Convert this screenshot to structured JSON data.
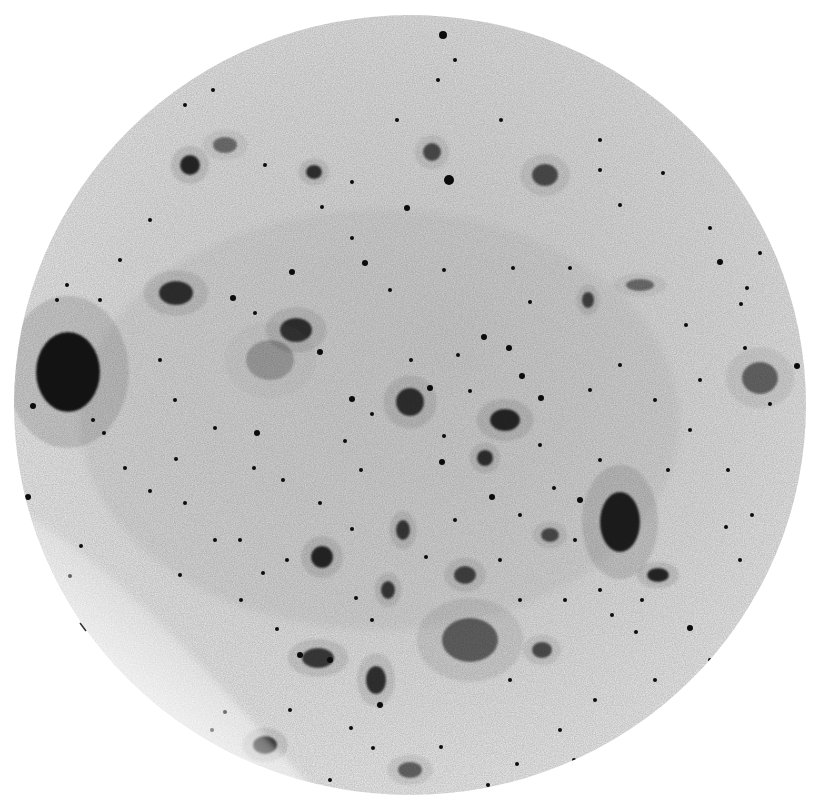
{
  "image": {
    "subject": "Inverted (negative) photographic plate of a galaxy star field",
    "width": 817,
    "height": 807,
    "background": "#ffffff",
    "field": {
      "cx": 410,
      "cy": 405,
      "rx": 396,
      "ry": 390,
      "tone": "#e4e4e4",
      "faded_edge": "#f7f7f7"
    },
    "ink": "#0d0d0d",
    "blobs": [
      {
        "x": 68,
        "y": 372,
        "rx": 32,
        "ry": 40,
        "o": 1.0
      },
      {
        "x": 620,
        "y": 522,
        "rx": 20,
        "ry": 30,
        "o": 0.95
      },
      {
        "x": 410,
        "y": 402,
        "rx": 14,
        "ry": 14,
        "o": 0.85
      },
      {
        "x": 505,
        "y": 420,
        "rx": 15,
        "ry": 11,
        "o": 0.9
      },
      {
        "x": 296,
        "y": 330,
        "rx": 16,
        "ry": 12,
        "o": 0.85
      },
      {
        "x": 176,
        "y": 293,
        "rx": 17,
        "ry": 12,
        "o": 0.85
      },
      {
        "x": 760,
        "y": 378,
        "rx": 18,
        "ry": 16,
        "o": 0.55
      },
      {
        "x": 545,
        "y": 175,
        "rx": 13,
        "ry": 11,
        "o": 0.7
      },
      {
        "x": 470,
        "y": 640,
        "rx": 28,
        "ry": 22,
        "o": 0.6
      },
      {
        "x": 318,
        "y": 658,
        "rx": 16,
        "ry": 10,
        "o": 0.8
      },
      {
        "x": 376,
        "y": 680,
        "rx": 10,
        "ry": 14,
        "o": 0.85
      },
      {
        "x": 265,
        "y": 745,
        "rx": 12,
        "ry": 9,
        "o": 0.9
      },
      {
        "x": 322,
        "y": 557,
        "rx": 11,
        "ry": 11,
        "o": 0.9
      },
      {
        "x": 658,
        "y": 575,
        "rx": 11,
        "ry": 7,
        "o": 0.9
      },
      {
        "x": 190,
        "y": 165,
        "rx": 10,
        "ry": 10,
        "o": 0.9
      },
      {
        "x": 432,
        "y": 152,
        "rx": 9,
        "ry": 9,
        "o": 0.7
      },
      {
        "x": 314,
        "y": 172,
        "rx": 8,
        "ry": 7,
        "o": 0.85
      },
      {
        "x": 270,
        "y": 360,
        "rx": 24,
        "ry": 20,
        "o": 0.25
      },
      {
        "x": 465,
        "y": 575,
        "rx": 11,
        "ry": 9,
        "o": 0.75
      },
      {
        "x": 550,
        "y": 535,
        "rx": 9,
        "ry": 7,
        "o": 0.7
      },
      {
        "x": 403,
        "y": 530,
        "rx": 7,
        "ry": 10,
        "o": 0.8
      },
      {
        "x": 388,
        "y": 590,
        "rx": 7,
        "ry": 9,
        "o": 0.8
      },
      {
        "x": 485,
        "y": 458,
        "rx": 8,
        "ry": 8,
        "o": 0.85
      },
      {
        "x": 640,
        "y": 285,
        "rx": 14,
        "ry": 6,
        "o": 0.5
      },
      {
        "x": 225,
        "y": 145,
        "rx": 12,
        "ry": 8,
        "o": 0.5
      },
      {
        "x": 588,
        "y": 300,
        "rx": 6,
        "ry": 8,
        "o": 0.75
      },
      {
        "x": 542,
        "y": 650,
        "rx": 10,
        "ry": 8,
        "o": 0.7
      },
      {
        "x": 410,
        "y": 770,
        "rx": 12,
        "ry": 8,
        "o": 0.6
      }
    ],
    "stars": [
      [
        443,
        35,
        4
      ],
      [
        449,
        180,
        5
      ],
      [
        407,
        208,
        3
      ],
      [
        365,
        263,
        3
      ],
      [
        292,
        272,
        3
      ],
      [
        233,
        298,
        3
      ],
      [
        255,
        313,
        2
      ],
      [
        509,
        348,
        3
      ],
      [
        522,
        376,
        3
      ],
      [
        541,
        398,
        3
      ],
      [
        530,
        302,
        2
      ],
      [
        484,
        337,
        3
      ],
      [
        458,
        355,
        2
      ],
      [
        430,
        388,
        3
      ],
      [
        372,
        414,
        2
      ],
      [
        352,
        399,
        3
      ],
      [
        345,
        441,
        2
      ],
      [
        361,
        470,
        2
      ],
      [
        257,
        433,
        3
      ],
      [
        215,
        428,
        2
      ],
      [
        185,
        503,
        2
      ],
      [
        150,
        491,
        2
      ],
      [
        70,
        576,
        2
      ],
      [
        81,
        546,
        2
      ],
      [
        28,
        497,
        3
      ],
      [
        33,
        406,
        3
      ],
      [
        160,
        360,
        2
      ],
      [
        320,
        352,
        3
      ],
      [
        442,
        462,
        3
      ],
      [
        444,
        436,
        2
      ],
      [
        470,
        391,
        2
      ],
      [
        411,
        360,
        2
      ],
      [
        492,
        497,
        3
      ],
      [
        540,
        445,
        2
      ],
      [
        580,
        500,
        3
      ],
      [
        554,
        488,
        2
      ],
      [
        600,
        460,
        2
      ],
      [
        668,
        470,
        2
      ],
      [
        728,
        470,
        2
      ],
      [
        726,
        527,
        2
      ],
      [
        752,
        515,
        2
      ],
      [
        741,
        304,
        2
      ],
      [
        747,
        288,
        2
      ],
      [
        720,
        262,
        3
      ],
      [
        686,
        325,
        2
      ],
      [
        797,
        366,
        3
      ],
      [
        770,
        404,
        2
      ],
      [
        636,
        632,
        2
      ],
      [
        690,
        628,
        3
      ],
      [
        710,
        660,
        2
      ],
      [
        690,
        720,
        2
      ],
      [
        688,
        740,
        2
      ],
      [
        595,
        700,
        2
      ],
      [
        510,
        680,
        2
      ],
      [
        560,
        730,
        2
      ],
      [
        517,
        764,
        2
      ],
      [
        441,
        747,
        2
      ],
      [
        373,
        748,
        2
      ],
      [
        351,
        728,
        2
      ],
      [
        290,
        710,
        2
      ],
      [
        287,
        560,
        2
      ],
      [
        241,
        600,
        2
      ],
      [
        263,
        573,
        2
      ],
      [
        277,
        629,
        2
      ],
      [
        180,
        575,
        2
      ],
      [
        215,
        540,
        2
      ],
      [
        240,
        540,
        2
      ],
      [
        356,
        598,
        2
      ],
      [
        372,
        620,
        2
      ],
      [
        426,
        557,
        2
      ],
      [
        352,
        529,
        2
      ],
      [
        320,
        503,
        2
      ],
      [
        283,
        480,
        2
      ],
      [
        254,
        468,
        2
      ],
      [
        176,
        459,
        2
      ],
      [
        125,
        468,
        2
      ],
      [
        104,
        433,
        2
      ],
      [
        93,
        420,
        2
      ],
      [
        600,
        170,
        2
      ],
      [
        620,
        205,
        2
      ],
      [
        663,
        173,
        2
      ],
      [
        570,
        268,
        2
      ],
      [
        513,
        268,
        2
      ],
      [
        444,
        270,
        2
      ],
      [
        390,
        290,
        2
      ],
      [
        352,
        238,
        2
      ],
      [
        322,
        207,
        2
      ],
      [
        265,
        165,
        2
      ],
      [
        352,
        182,
        2
      ],
      [
        397,
        120,
        2
      ],
      [
        438,
        80,
        2
      ],
      [
        455,
        60,
        2
      ],
      [
        501,
        120,
        2
      ],
      [
        600,
        140,
        2
      ],
      [
        710,
        228,
        2
      ],
      [
        760,
        253,
        2
      ],
      [
        773,
        236,
        2
      ],
      [
        150,
        220,
        2
      ],
      [
        120,
        260,
        2
      ],
      [
        100,
        300,
        2
      ],
      [
        67,
        285,
        2
      ],
      [
        57,
        300,
        2
      ],
      [
        185,
        105,
        2
      ],
      [
        213,
        90,
        2
      ],
      [
        175,
        400,
        2
      ],
      [
        600,
        590,
        2
      ],
      [
        612,
        615,
        2
      ],
      [
        642,
        600,
        2
      ],
      [
        565,
        600,
        2
      ],
      [
        520,
        600,
        2
      ],
      [
        500,
        560,
        2
      ],
      [
        455,
        520,
        2
      ],
      [
        520,
        515,
        2
      ],
      [
        575,
        540,
        2
      ],
      [
        760,
        600,
        2
      ],
      [
        740,
        560,
        2
      ],
      [
        300,
        655,
        3
      ],
      [
        330,
        660,
        3
      ],
      [
        380,
        705,
        3
      ],
      [
        330,
        780,
        2
      ],
      [
        240,
        780,
        2
      ],
      [
        212,
        730,
        2
      ],
      [
        225,
        712,
        2
      ],
      [
        590,
        390,
        2
      ],
      [
        620,
        365,
        2
      ],
      [
        655,
        400,
        2
      ],
      [
        690,
        430,
        2
      ],
      [
        700,
        380,
        2
      ],
      [
        745,
        348,
        2
      ],
      [
        655,
        680,
        2
      ],
      [
        620,
        760,
        2
      ],
      [
        574,
        760,
        2
      ],
      [
        488,
        785,
        2
      ]
    ],
    "caption": {
      "text_visible": "",
      "note": "caption line cropped at bottom edge, unreadable"
    }
  }
}
